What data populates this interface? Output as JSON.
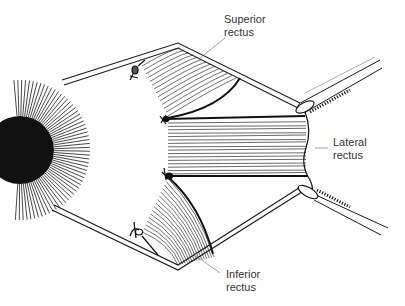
{
  "figure": {
    "type": "anatomical-surgical-illustration",
    "colors": {
      "line": "#1a1a1a",
      "label": "#333333",
      "background": "#ffffff"
    }
  },
  "labels": {
    "superior_rectus": {
      "line1": "Superior",
      "line2": "rectus"
    },
    "lateral_rectus": {
      "line1": "Lateral",
      "line2": "rectus"
    },
    "inferior_rectus": {
      "line1": "Inferior",
      "line2": "rectus"
    }
  }
}
